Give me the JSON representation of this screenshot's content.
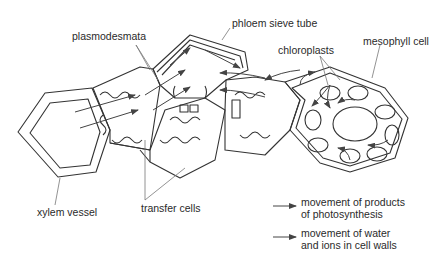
{
  "diagram": {
    "labels": {
      "plasmodesmata": "plasmodesmata",
      "phloem_sieve_tube": "phloem sieve tube",
      "chloroplasts": "chloroplasts",
      "mesophyll_cell": "mesophyll cell",
      "xylem_vessel": "xylem vessel",
      "transfer_cells": "transfer cells"
    },
    "legend": [
      {
        "icon": "arrow-right-icon",
        "line1": "movement of products",
        "line2": "of photosynthesis"
      },
      {
        "icon": "arrow-right-icon",
        "line1": "movement of water",
        "line2": "and ions in cell walls"
      }
    ],
    "colors": {
      "stroke": "#333333",
      "leader": "#777777",
      "text": "#2a2a2a"
    }
  }
}
